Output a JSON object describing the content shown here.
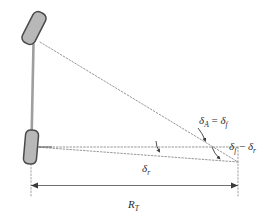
{
  "figure": {
    "type": "technical-diagram",
    "background_color": "#ffffff",
    "line_color": "#6e6e6e",
    "dotted_color": "#8a8a8a",
    "wheel_fill": "#b8b8b8",
    "wheel_stroke": "#4a4a4a",
    "text_color": "#2b2b2b"
  },
  "labels": {
    "ackermann_angle": {
      "symbol": "δ",
      "subscript": "A",
      "operator": "=",
      "symbol2": "δ",
      "subscript2": "f",
      "full_text": "δA = δf"
    },
    "angle_difference": {
      "symbol": "δ",
      "subscript": "f",
      "operator": "−",
      "symbol2": "δ",
      "subscript2": "r",
      "full_text": "δf − δr"
    },
    "rear_steer_angle": {
      "symbol": "δ",
      "subscript": "r",
      "full_text": "δr"
    },
    "turn_radius": {
      "symbol": "R",
      "subscript": "T",
      "full_text": "RT"
    }
  },
  "elements": {
    "front_wheel": "front-wheel",
    "rear_wheel": "rear-wheel",
    "wheelbase_line": "wheelbase-line",
    "front_axle_ray": "front-axle-perpendicular-ray",
    "rear_axle_ray": "rear-axle-perpendicular-ray",
    "rear_horizontal_reference": "rear-horizontal-reference-line",
    "turn_center_vertical": "turn-center-vertical-line",
    "rear_wheel_vertical": "rear-wheel-vertical-line",
    "dimension_line": "turn-radius-dimension-line",
    "arc_upper": "upper-angle-arc",
    "arc_lower": "lower-angle-arc",
    "arc_rear": "rear-angle-arc"
  }
}
